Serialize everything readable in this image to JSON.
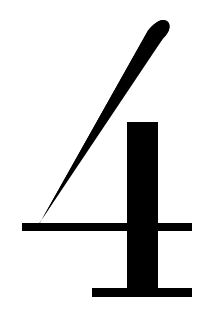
{
  "image": {
    "kind": "glyph-render",
    "character": "4",
    "character_name": "digit-four",
    "width": 210,
    "height": 329
  },
  "colors": {
    "background": "#ffffff",
    "foreground": "#000000"
  },
  "glyph": {
    "text": "4",
    "style": "serif",
    "weight": "bold",
    "parts": [
      {
        "name": "diagonal-stroke",
        "description": "tapered diagonal from upper right to lower left with rounded tip"
      },
      {
        "name": "crossbar",
        "description": "horizontal bar crossing the stem"
      },
      {
        "name": "vertical-stem",
        "description": "thick vertical stem on the right"
      },
      {
        "name": "foot-serif",
        "description": "horizontal foot serif at the bottom of the stem"
      }
    ],
    "geometry": {
      "diagonal_tip": {
        "x": 168,
        "y": 22
      },
      "diagonal_base": {
        "x": 22,
        "y": 230
      },
      "crossbar": {
        "x1": 22,
        "y1": 223,
        "x2": 192,
        "y2": 231
      },
      "stem": {
        "x1": 127,
        "y1": 122,
        "x2": 158,
        "y2": 288
      },
      "foot": {
        "x1": 92,
        "y1": 288,
        "x2": 192,
        "y2": 297
      }
    }
  }
}
